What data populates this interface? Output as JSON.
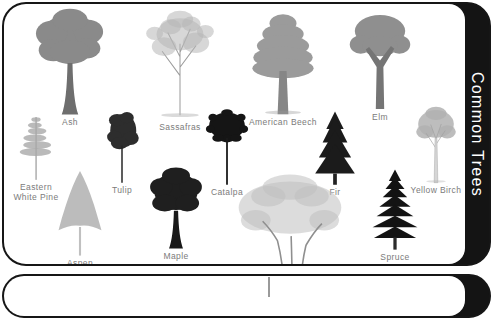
{
  "card": {
    "title": "Common Trees",
    "band_color": "#141414",
    "title_color": "#ffffff",
    "border_color": "#161616",
    "background": "#ffffff",
    "label_color": "#7b7b7b"
  },
  "trees": [
    {
      "id": "ash",
      "label": "Ash",
      "shape": "broad-round",
      "tone": "#8a8a8a",
      "trunk": "#6e6e6e",
      "box": {
        "x": 20,
        "y": 2,
        "w": 92,
        "h": 95
      }
    },
    {
      "id": "sassafras",
      "label": "Sassafras",
      "shape": "open-sketch",
      "tone": "#b6b6b6",
      "trunk": "#9c9c9c",
      "box": {
        "x": 129,
        "y": 4,
        "w": 94,
        "h": 95
      }
    },
    {
      "id": "american-beech",
      "label": "American Beech",
      "shape": "layered-oval",
      "tone": "#9b9b9b",
      "trunk": "#868686",
      "box": {
        "x": 234,
        "y": 4,
        "w": 90,
        "h": 93
      }
    },
    {
      "id": "elm",
      "label": "Elm",
      "shape": "vase",
      "tone": "#8f8f8f",
      "trunk": "#757575",
      "box": {
        "x": 334,
        "y": 6,
        "w": 84,
        "h": 92
      }
    },
    {
      "id": "eastern-white-pine",
      "label": "Eastern\nWhite Pine",
      "shape": "pine-sparse",
      "tone": "#a9a9a9",
      "trunk": "#8a8a8a",
      "box": {
        "x": 3,
        "y": 90,
        "w": 58,
        "h": 108
      }
    },
    {
      "id": "tulip",
      "label": "Tulip",
      "shape": "oval-dark",
      "tone": "#2d2d2d",
      "trunk": "#262626",
      "box": {
        "x": 87,
        "y": 94,
        "w": 62,
        "h": 97
      }
    },
    {
      "id": "catalpa",
      "label": "Catalpa",
      "shape": "lollipop",
      "tone": "#151515",
      "trunk": "#1a1a1a",
      "box": {
        "x": 191,
        "y": 94,
        "w": 64,
        "h": 99
      }
    },
    {
      "id": "fir",
      "label": "Fir",
      "shape": "conifer",
      "tone": "#1b1b1b",
      "trunk": "#222222",
      "box": {
        "x": 300,
        "y": 91,
        "w": 62,
        "h": 102
      }
    },
    {
      "id": "yellow-birch",
      "label": "Yellow Birch",
      "shape": "round-light",
      "tone": "#b1b1b1",
      "trunk": "#c9c9c9",
      "box": {
        "x": 399,
        "y": 96,
        "w": 66,
        "h": 95
      }
    },
    {
      "id": "aspen",
      "label": "Aspen",
      "shape": "triangle-light",
      "tone": "#b5b5b5",
      "trunk": "#c4c4c4",
      "box": {
        "x": 39,
        "y": 164,
        "w": 74,
        "h": 94
      }
    },
    {
      "id": "maple",
      "label": "Maple",
      "shape": "broad-dark",
      "tone": "#1f1f1f",
      "trunk": "#191919",
      "box": {
        "x": 137,
        "y": 162,
        "w": 70,
        "h": 94
      }
    },
    {
      "id": "sycamore",
      "label": "Sycamore",
      "shape": "spreading",
      "tone": "#c0c0c0",
      "trunk": "#8f8f8f",
      "box": {
        "x": 229,
        "y": 166,
        "w": 114,
        "h": 92
      }
    },
    {
      "id": "spruce",
      "label": "Spruce",
      "shape": "spruce",
      "tone": "#131313",
      "trunk": "#2b2b2b",
      "box": {
        "x": 357,
        "y": 160,
        "w": 68,
        "h": 98
      }
    }
  ],
  "second_card": {
    "stem_color": "#9a9a9a"
  }
}
